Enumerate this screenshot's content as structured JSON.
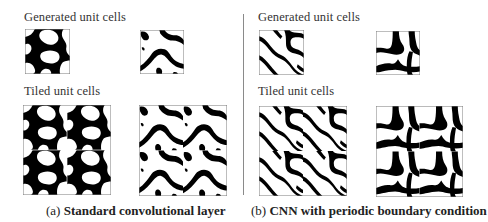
{
  "panels": [
    {
      "id": "a",
      "generated_label": "Generated unit cells",
      "tiled_label": "Tiled unit cells",
      "caption_prefix": "(a)",
      "caption_title": "Standard convolutional layer"
    },
    {
      "id": "b",
      "generated_label": "Generated unit cells",
      "tiled_label": "Tiled unit cells",
      "caption_prefix": "(b)",
      "caption_title": "CNN with periodic boundary condition"
    }
  ],
  "colors": {
    "material": "#000000",
    "void": "#ffffff",
    "frame": "#777777",
    "divider": "#8a8a8a"
  }
}
